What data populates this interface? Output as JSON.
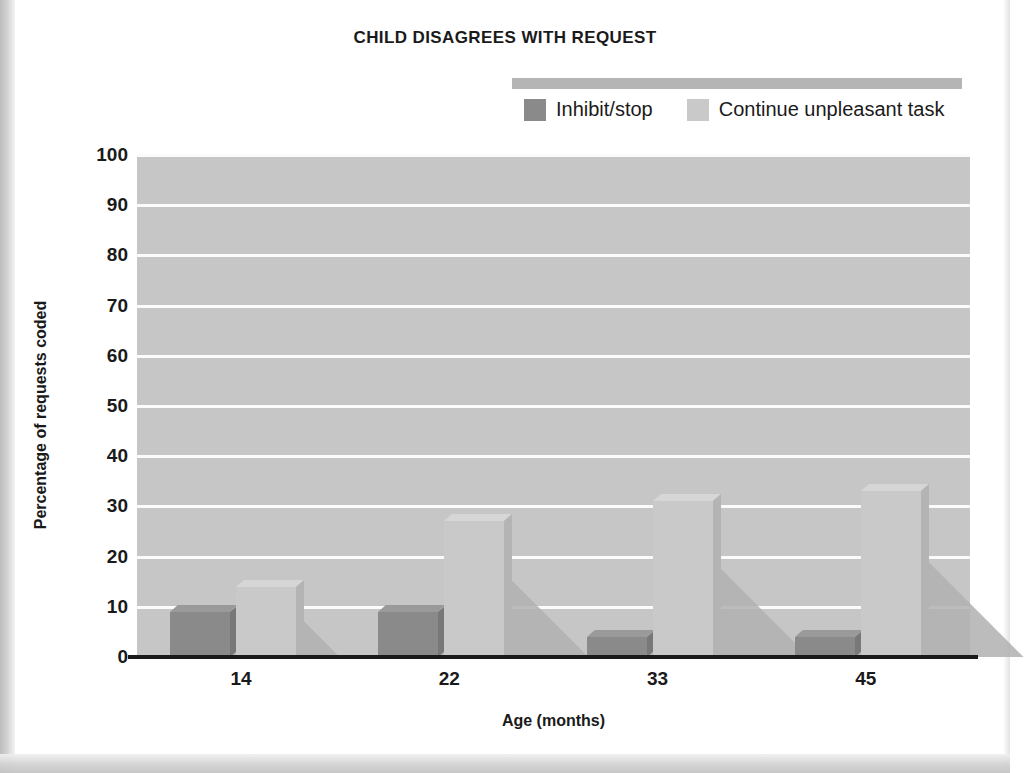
{
  "chart_data": {
    "type": "bar",
    "title": "CHILD DISAGREES WITH REQUEST",
    "xlabel": "Age (months)",
    "ylabel": "Percentage of requests coded",
    "categories": [
      "14",
      "22",
      "33",
      "45"
    ],
    "series": [
      {
        "name": "Inhibit/stop",
        "color": "#8a8a8a",
        "values": [
          9,
          9,
          4,
          4
        ]
      },
      {
        "name": "Continue unpleasant task",
        "color": "#c9c9c9",
        "values": [
          14,
          27,
          31,
          33
        ]
      }
    ],
    "ylim": [
      0,
      100
    ],
    "yticks": [
      0,
      10,
      20,
      30,
      40,
      50,
      60,
      70,
      80,
      90,
      100
    ],
    "ytick_labels": [
      "0",
      "10",
      "20",
      "30",
      "40",
      "50",
      "60",
      "70",
      "80",
      "90",
      "100"
    ],
    "grid": true,
    "grid_color": "#fbfbfb",
    "plot_background": "#c6c6c6",
    "legend_position": "top-right"
  },
  "colors": {
    "page_background": "#ffffff",
    "text": "#1a1a1a",
    "axis": "#1a1a1a",
    "legend_strip": "#b5b5b5"
  }
}
